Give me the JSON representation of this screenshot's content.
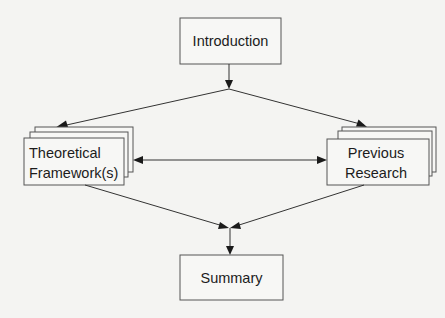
{
  "diagram": {
    "type": "flowchart",
    "nodes": {
      "introduction": {
        "label": "Introduction",
        "style": "single"
      },
      "theoretical": {
        "label_line1": "Theoretical",
        "label_line2": "Framework(s)",
        "style": "stacked"
      },
      "previous": {
        "label_line1": "Previous",
        "label_line2": "Research",
        "style": "stacked"
      },
      "summary": {
        "label": "Summary",
        "style": "single"
      }
    },
    "edges": [
      {
        "from": "introduction",
        "to": "branch-junction",
        "arrow": "end"
      },
      {
        "from": "branch-junction",
        "to": "theoretical",
        "arrow": "end"
      },
      {
        "from": "branch-junction",
        "to": "previous",
        "arrow": "end"
      },
      {
        "from": "theoretical",
        "to": "previous",
        "arrow": "both"
      },
      {
        "from": "theoretical",
        "to": "merge-junction",
        "arrow": "end"
      },
      {
        "from": "previous",
        "to": "merge-junction",
        "arrow": "end"
      },
      {
        "from": "merge-junction",
        "to": "summary",
        "arrow": "end"
      }
    ]
  }
}
